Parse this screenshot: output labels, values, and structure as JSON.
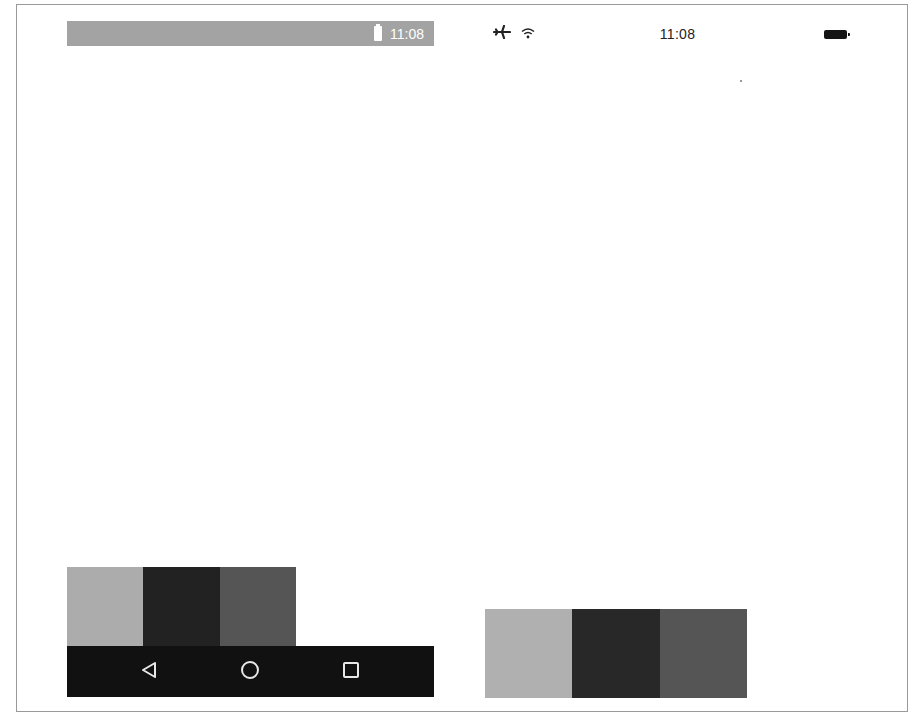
{
  "android": {
    "status_bar": {
      "time": "11:08",
      "battery_icon": "battery-icon",
      "background": "#a3a3a3"
    },
    "swatches": [
      {
        "name": "primary",
        "color": "#acacac"
      },
      {
        "name": "primary-dark",
        "color": "#222222"
      },
      {
        "name": "accent",
        "color": "#555555"
      }
    ],
    "nav_bar": {
      "background": "#111111",
      "buttons": [
        {
          "name": "back",
          "icon": "back-triangle-icon"
        },
        {
          "name": "home",
          "icon": "home-circle-icon"
        },
        {
          "name": "recents",
          "icon": "recents-square-icon"
        }
      ]
    }
  },
  "ios": {
    "status_bar": {
      "time": "11:08",
      "airplane_icon": "airplane-icon",
      "wifi_icon": "wifi-icon",
      "battery_icon": "battery-icon"
    },
    "swatches": [
      {
        "name": "primary",
        "color": "#b0b0b0"
      },
      {
        "name": "primary-dark",
        "color": "#282828"
      },
      {
        "name": "accent",
        "color": "#555555"
      }
    ]
  }
}
